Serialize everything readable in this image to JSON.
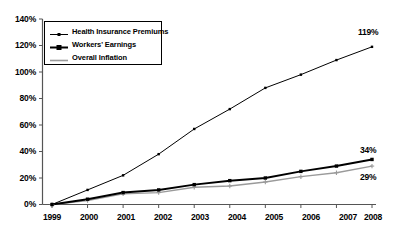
{
  "chart_data": {
    "type": "line",
    "title": "",
    "subtitle": "",
    "xlabel": "",
    "ylabel": "",
    "categories": [
      "1999",
      "2000",
      "2001",
      "2002",
      "2003",
      "2004",
      "2005",
      "2006",
      "2007",
      "2008"
    ],
    "x": [
      1999,
      2000,
      2001,
      2002,
      2003,
      2004,
      2005,
      2006,
      2007,
      2008
    ],
    "ylim": [
      0,
      140
    ],
    "ytick_labels": [
      "0%",
      "20%",
      "40%",
      "60%",
      "80%",
      "100%",
      "120%",
      "140%"
    ],
    "ytick_values": [
      0,
      20,
      40,
      60,
      80,
      100,
      120,
      140
    ],
    "grid": false,
    "legend_position": "top-left",
    "series": [
      {
        "name": "Health Insurance Premiums",
        "color": "#000000",
        "line_width": 1,
        "marker": "square-small",
        "values": [
          0,
          11,
          22,
          38,
          57,
          72,
          88,
          98,
          109,
          119
        ],
        "end_label": "119%"
      },
      {
        "name": "Workers' Earnings",
        "color": "#000000",
        "line_width": 2,
        "marker": "square",
        "values": [
          0,
          4,
          9,
          11,
          15,
          18,
          20,
          25,
          29,
          34
        ],
        "end_label": "34%"
      },
      {
        "name": "Overall Inflation",
        "color": "#9a9a9a",
        "line_width": 1.4,
        "marker": "plus",
        "values": [
          0,
          3,
          8,
          9,
          13,
          14,
          17,
          21,
          24,
          29
        ],
        "end_label": "29%"
      }
    ],
    "annotations": [
      {
        "text": "119%",
        "series": "Health Insurance Premiums",
        "at_category": "2008"
      },
      {
        "text": "34%",
        "series": "Workers' Earnings",
        "at_category": "2008"
      },
      {
        "text": "29%",
        "series": "Overall Inflation",
        "at_category": "2008"
      }
    ]
  },
  "legend": {
    "items": [
      {
        "label": "Health Insurance Premiums"
      },
      {
        "label": "Workers' Earnings"
      },
      {
        "label": "Overall Inflation"
      }
    ]
  },
  "axis": {
    "y_labels": [
      "140%",
      "120%",
      "100%",
      "80%",
      "60%",
      "40%",
      "20%",
      "0%"
    ],
    "x_labels": [
      "1999",
      "2000",
      "2001",
      "2002",
      "2003",
      "2004",
      "2005",
      "2006",
      "2007",
      "2008"
    ]
  },
  "end_labels": {
    "premiums": "119%",
    "earnings": "34%",
    "inflation": "29%"
  },
  "colors": {
    "premiums": "#000000",
    "earnings": "#000000",
    "inflation": "#9a9a9a",
    "axis": "#555555",
    "background": "#ffffff"
  }
}
